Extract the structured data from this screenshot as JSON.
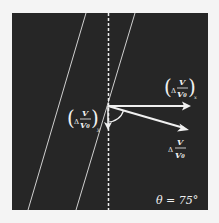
{
  "diagram": {
    "colors": {
      "background": "#f4f4f4",
      "panel": "#262626",
      "stroke": "#f0f0f0",
      "line": "#cfcfcf"
    },
    "vectors": {
      "x_component": {
        "label_delta": "Δ",
        "label_num": "V",
        "label_den": "V₀",
        "label_sub": "x"
      },
      "y_component": {
        "label_delta": "Δ",
        "label_num": "V",
        "label_den": "V₀",
        "label_sub": "y"
      },
      "resultant": {
        "label_delta": "Δ",
        "label_num": "V",
        "label_den": "V₀"
      }
    },
    "angle": {
      "symbol": "θ",
      "equals": "=",
      "value": "75°",
      "text": "θ = 75°"
    }
  }
}
